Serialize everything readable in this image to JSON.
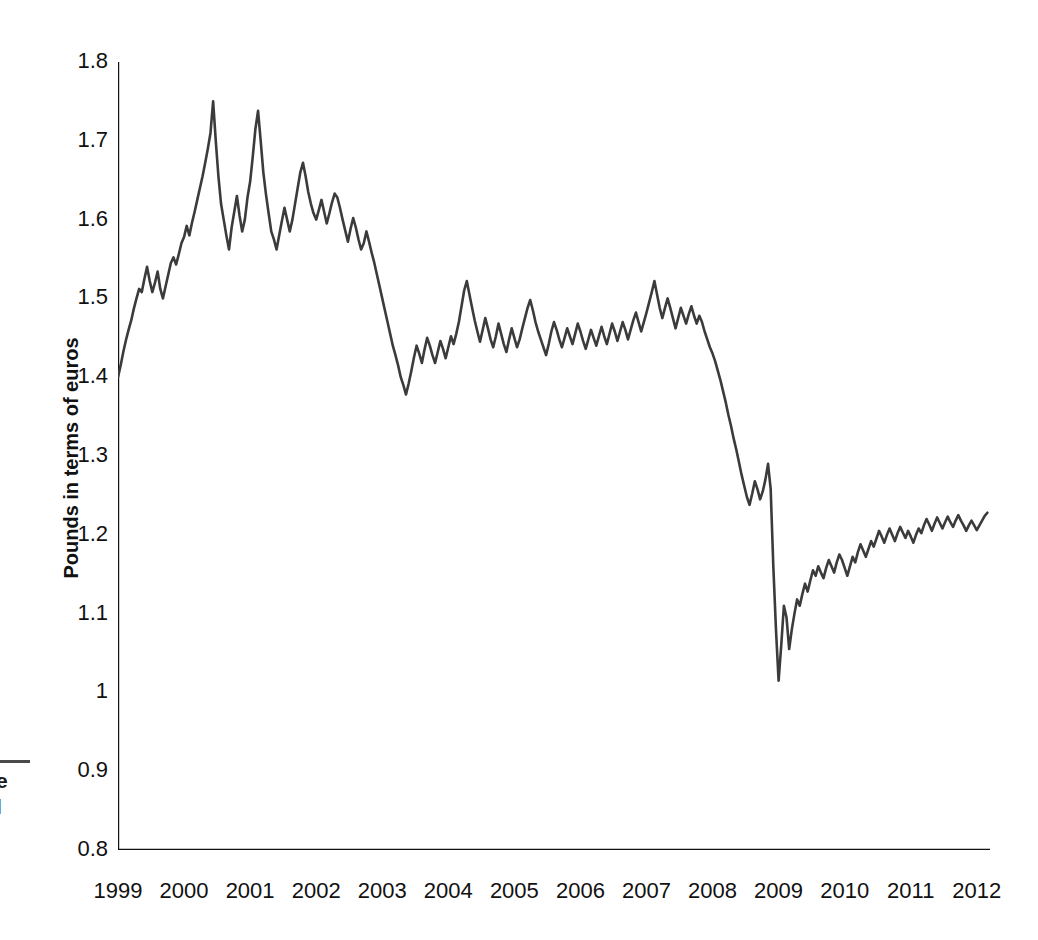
{
  "figure": {
    "caption_fragment": {
      "line1": "e",
      "line2": "l"
    }
  },
  "chart_data": {
    "type": "line",
    "title": "",
    "subtitle": "",
    "xlabel": "",
    "ylabel": "Pounds in terms of euros",
    "xlim": [
      1999.0,
      2012.2
    ],
    "ylim": [
      0.8,
      1.8
    ],
    "grid": false,
    "legend": null,
    "line_color": "#3b3b3b",
    "line_width": 2.6,
    "axis_color": "#111111",
    "band_color": "#dcdcdc",
    "background": "#ffffff",
    "ytick_labels": [
      "1.8",
      "1.7",
      "1.6",
      "1.5",
      "1.4",
      "1.3",
      "1.2",
      "1.1",
      "1",
      "0.9",
      "0.8"
    ],
    "ytick_values": [
      1.8,
      1.7,
      1.6,
      1.5,
      1.4,
      1.3,
      1.2,
      1.1,
      1.0,
      0.9,
      0.8
    ],
    "xtick_labels": [
      "1999",
      "2000",
      "2001",
      "2002",
      "2003",
      "2004",
      "2005",
      "2006",
      "2007",
      "2008",
      "2009",
      "2010",
      "2011",
      "2012"
    ],
    "xtick_values": [
      1999,
      2000,
      2001,
      2002,
      2003,
      2004,
      2005,
      2006,
      2007,
      2008,
      2009,
      2010,
      2011,
      2012
    ],
    "minor_tick_interval": 0.5,
    "series": [
      {
        "name": "GBP per EUR",
        "x": [
          1999.0,
          1999.04,
          1999.08,
          1999.12,
          1999.16,
          1999.2,
          1999.24,
          1999.28,
          1999.32,
          1999.36,
          1999.4,
          1999.44,
          1999.48,
          1999.52,
          1999.56,
          1999.6,
          1999.64,
          1999.68,
          1999.72,
          1999.76,
          1999.8,
          1999.84,
          1999.88,
          1999.92,
          1999.96,
          2000.0,
          2000.04,
          2000.08,
          2000.12,
          2000.16,
          2000.2,
          2000.24,
          2000.28,
          2000.32,
          2000.36,
          2000.4,
          2000.44,
          2000.48,
          2000.52,
          2000.56,
          2000.6,
          2000.64,
          2000.68,
          2000.72,
          2000.76,
          2000.8,
          2000.84,
          2000.88,
          2000.92,
          2000.96,
          2001.0,
          2001.04,
          2001.08,
          2001.12,
          2001.16,
          2001.2,
          2001.24,
          2001.28,
          2001.32,
          2001.36,
          2001.4,
          2001.44,
          2001.48,
          2001.52,
          2001.56,
          2001.6,
          2001.64,
          2001.68,
          2001.72,
          2001.76,
          2001.8,
          2001.84,
          2001.88,
          2001.92,
          2001.96,
          2002.0,
          2002.04,
          2002.08,
          2002.12,
          2002.16,
          2002.2,
          2002.24,
          2002.28,
          2002.32,
          2002.36,
          2002.4,
          2002.44,
          2002.48,
          2002.52,
          2002.56,
          2002.6,
          2002.64,
          2002.68,
          2002.72,
          2002.76,
          2002.8,
          2002.84,
          2002.88,
          2002.92,
          2002.96,
          2003.0,
          2003.04,
          2003.08,
          2003.12,
          2003.16,
          2003.2,
          2003.24,
          2003.28,
          2003.32,
          2003.36,
          2003.4,
          2003.44,
          2003.48,
          2003.52,
          2003.56,
          2003.6,
          2003.64,
          2003.68,
          2003.72,
          2003.76,
          2003.8,
          2003.84,
          2003.88,
          2003.92,
          2003.96,
          2004.0,
          2004.04,
          2004.08,
          2004.12,
          2004.16,
          2004.2,
          2004.24,
          2004.28,
          2004.32,
          2004.36,
          2004.4,
          2004.44,
          2004.48,
          2004.52,
          2004.56,
          2004.6,
          2004.64,
          2004.68,
          2004.72,
          2004.76,
          2004.8,
          2004.84,
          2004.88,
          2004.92,
          2004.96,
          2005.0,
          2005.04,
          2005.08,
          2005.12,
          2005.16,
          2005.2,
          2005.24,
          2005.28,
          2005.32,
          2005.36,
          2005.4,
          2005.44,
          2005.48,
          2005.52,
          2005.56,
          2005.6,
          2005.64,
          2005.68,
          2005.72,
          2005.76,
          2005.8,
          2005.84,
          2005.88,
          2005.92,
          2005.96,
          2006.0,
          2006.04,
          2006.08,
          2006.12,
          2006.16,
          2006.2,
          2006.24,
          2006.28,
          2006.32,
          2006.36,
          2006.4,
          2006.44,
          2006.48,
          2006.52,
          2006.56,
          2006.6,
          2006.64,
          2006.68,
          2006.72,
          2006.76,
          2006.8,
          2006.84,
          2006.88,
          2006.92,
          2006.96,
          2007.0,
          2007.04,
          2007.08,
          2007.12,
          2007.16,
          2007.2,
          2007.24,
          2007.28,
          2007.32,
          2007.36,
          2007.4,
          2007.44,
          2007.48,
          2007.52,
          2007.56,
          2007.6,
          2007.64,
          2007.68,
          2007.72,
          2007.76,
          2007.8,
          2007.84,
          2007.88,
          2007.92,
          2007.96,
          2008.0,
          2008.04,
          2008.08,
          2008.12,
          2008.16,
          2008.2,
          2008.24,
          2008.28,
          2008.32,
          2008.36,
          2008.4,
          2008.44,
          2008.48,
          2008.52,
          2008.56,
          2008.6,
          2008.64,
          2008.68,
          2008.72,
          2008.76,
          2008.8,
          2008.84,
          2008.88,
          2008.92,
          2008.96,
          2009.0,
          2009.04,
          2009.08,
          2009.12,
          2009.16,
          2009.2,
          2009.24,
          2009.28,
          2009.32,
          2009.36,
          2009.4,
          2009.44,
          2009.48,
          2009.52,
          2009.56,
          2009.6,
          2009.64,
          2009.68,
          2009.72,
          2009.76,
          2009.8,
          2009.84,
          2009.88,
          2009.92,
          2009.96,
          2010.0,
          2010.04,
          2010.08,
          2010.12,
          2010.16,
          2010.2,
          2010.24,
          2010.28,
          2010.32,
          2010.36,
          2010.4,
          2010.44,
          2010.48,
          2010.52,
          2010.56,
          2010.6,
          2010.64,
          2010.68,
          2010.72,
          2010.76,
          2010.8,
          2010.84,
          2010.88,
          2010.92,
          2010.96,
          2011.0,
          2011.04,
          2011.08,
          2011.12,
          2011.16,
          2011.2,
          2011.24,
          2011.28,
          2011.32,
          2011.36,
          2011.4,
          2011.44,
          2011.48,
          2011.52,
          2011.56,
          2011.6,
          2011.64,
          2011.68,
          2011.72,
          2011.76,
          2011.8,
          2011.84,
          2011.88,
          2011.92,
          2011.96,
          2012.0,
          2012.04,
          2012.08,
          2012.12,
          2012.16
        ],
        "values": [
          1.4,
          1.415,
          1.432,
          1.447,
          1.46,
          1.472,
          1.487,
          1.5,
          1.512,
          1.508,
          1.525,
          1.54,
          1.522,
          1.508,
          1.52,
          1.534,
          1.512,
          1.5,
          1.515,
          1.53,
          1.545,
          1.552,
          1.543,
          1.556,
          1.57,
          1.578,
          1.592,
          1.58,
          1.596,
          1.61,
          1.625,
          1.64,
          1.655,
          1.672,
          1.69,
          1.71,
          1.75,
          1.7,
          1.655,
          1.62,
          1.6,
          1.58,
          1.562,
          1.59,
          1.61,
          1.63,
          1.605,
          1.585,
          1.6,
          1.628,
          1.648,
          1.68,
          1.715,
          1.738,
          1.7,
          1.66,
          1.632,
          1.608,
          1.585,
          1.575,
          1.562,
          1.58,
          1.598,
          1.615,
          1.6,
          1.585,
          1.6,
          1.62,
          1.64,
          1.66,
          1.672,
          1.655,
          1.635,
          1.62,
          1.608,
          1.6,
          1.612,
          1.625,
          1.61,
          1.595,
          1.608,
          1.622,
          1.633,
          1.628,
          1.615,
          1.6,
          1.586,
          1.572,
          1.588,
          1.602,
          1.59,
          1.575,
          1.562,
          1.57,
          1.585,
          1.572,
          1.558,
          1.545,
          1.53,
          1.515,
          1.5,
          1.485,
          1.47,
          1.455,
          1.44,
          1.428,
          1.415,
          1.4,
          1.39,
          1.378,
          1.392,
          1.408,
          1.425,
          1.44,
          1.43,
          1.418,
          1.435,
          1.45,
          1.44,
          1.428,
          1.418,
          1.432,
          1.446,
          1.436,
          1.424,
          1.438,
          1.452,
          1.442,
          1.455,
          1.47,
          1.49,
          1.51,
          1.522,
          1.505,
          1.488,
          1.472,
          1.458,
          1.445,
          1.46,
          1.475,
          1.462,
          1.448,
          1.438,
          1.452,
          1.468,
          1.455,
          1.442,
          1.432,
          1.448,
          1.462,
          1.45,
          1.438,
          1.448,
          1.462,
          1.475,
          1.488,
          1.498,
          1.485,
          1.47,
          1.458,
          1.448,
          1.438,
          1.428,
          1.442,
          1.458,
          1.47,
          1.46,
          1.448,
          1.438,
          1.45,
          1.462,
          1.452,
          1.442,
          1.455,
          1.468,
          1.458,
          1.446,
          1.436,
          1.448,
          1.46,
          1.45,
          1.44,
          1.452,
          1.464,
          1.452,
          1.442,
          1.455,
          1.468,
          1.458,
          1.446,
          1.458,
          1.47,
          1.46,
          1.448,
          1.46,
          1.472,
          1.482,
          1.47,
          1.458,
          1.47,
          1.482,
          1.495,
          1.508,
          1.522,
          1.505,
          1.488,
          1.475,
          1.488,
          1.5,
          1.488,
          1.475,
          1.462,
          1.475,
          1.488,
          1.478,
          1.468,
          1.48,
          1.49,
          1.478,
          1.468,
          1.478,
          1.47,
          1.458,
          1.448,
          1.438,
          1.43,
          1.42,
          1.408,
          1.396,
          1.382,
          1.368,
          1.352,
          1.338,
          1.322,
          1.308,
          1.292,
          1.276,
          1.262,
          1.248,
          1.238,
          1.252,
          1.268,
          1.258,
          1.245,
          1.255,
          1.27,
          1.29,
          1.258,
          1.16,
          1.08,
          1.015,
          1.06,
          1.11,
          1.095,
          1.055,
          1.08,
          1.1,
          1.118,
          1.11,
          1.125,
          1.138,
          1.128,
          1.142,
          1.155,
          1.148,
          1.16,
          1.152,
          1.145,
          1.158,
          1.168,
          1.16,
          1.152,
          1.165,
          1.175,
          1.168,
          1.158,
          1.148,
          1.16,
          1.172,
          1.165,
          1.178,
          1.188,
          1.18,
          1.172,
          1.182,
          1.192,
          1.185,
          1.195,
          1.205,
          1.198,
          1.19,
          1.2,
          1.208,
          1.2,
          1.192,
          1.202,
          1.21,
          1.203,
          1.196,
          1.205,
          1.198,
          1.19,
          1.2,
          1.208,
          1.202,
          1.212,
          1.22,
          1.213,
          1.205,
          1.214,
          1.222,
          1.215,
          1.208,
          1.216,
          1.223,
          1.216,
          1.21,
          1.218,
          1.225,
          1.218,
          1.212,
          1.205,
          1.212,
          1.218,
          1.212,
          1.206,
          1.212,
          1.218,
          1.224,
          1.228
        ]
      }
    ]
  }
}
